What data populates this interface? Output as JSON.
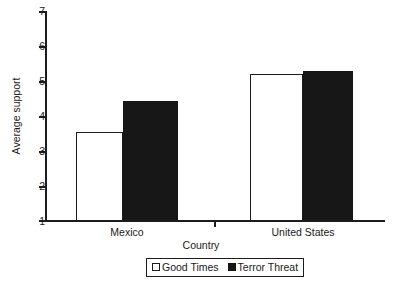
{
  "chart_data": {
    "type": "bar",
    "title": "",
    "subtitle": "",
    "xlabel": "Country",
    "ylabel": "Average support",
    "categories": [
      "Mexico",
      "United States"
    ],
    "series": [
      {
        "name": "Good Times",
        "values": [
          3.55,
          5.2
        ],
        "color": "#ffffff",
        "edge_color": "#1c1c1c"
      },
      {
        "name": "Terror Threat",
        "values": [
          4.45,
          5.3
        ],
        "color": "#171717",
        "edge_color": "#141414"
      }
    ],
    "ylim": [
      1,
      7
    ],
    "yticks": [
      1,
      2,
      3,
      4,
      5,
      6,
      7
    ],
    "ytick_labels": [
      "1",
      "2",
      "3",
      "4",
      "5",
      "6",
      "7"
    ],
    "grid": false,
    "legend_position": "bottom-center",
    "annotations": []
  },
  "axes": {
    "y_title": "Average support",
    "x_title": "Country"
  },
  "legend": {
    "entries": [
      {
        "label": "Good Times",
        "swatch": "open-square-icon"
      },
      {
        "label": "Terror Threat",
        "swatch": "filled-square-icon"
      }
    ]
  }
}
